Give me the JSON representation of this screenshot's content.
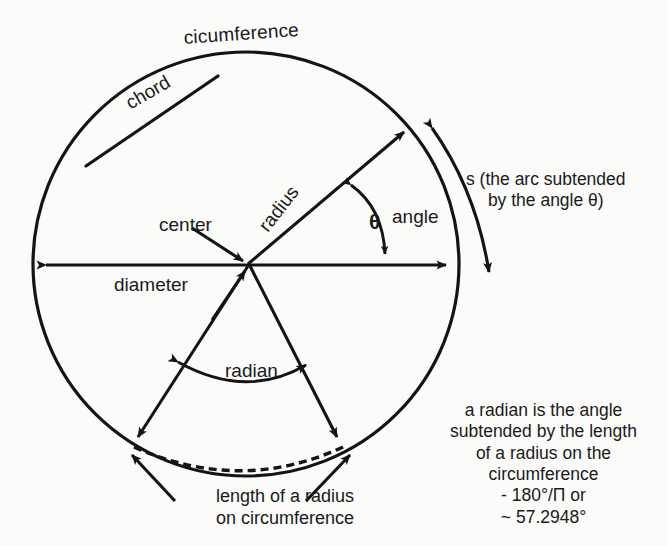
{
  "diagram": {
    "ink_color": "#141414",
    "background_color": "#fbfbfa",
    "labels": {
      "circumference": "cicumference",
      "chord": "chord",
      "radius": "radius",
      "center": "center",
      "diameter": "diameter",
      "theta": "θ",
      "angle": "angle",
      "radian": "radian",
      "arc_s": "s (the arc subtended\nby the angle θ)",
      "radian_definition": "a radian is the angle\nsubtended by the length\nof a radius on the\ncircumference\n- 180°/Π or\n~ 57.2948°",
      "length_of_radius": "length of a radius\non circumference"
    },
    "values": {
      "degrees_half_turn": "180°",
      "pi_symbol": "Π",
      "radian_in_degrees": "57.2948°"
    },
    "geometry": {
      "circle_center_x": 246,
      "circle_center_y": 264,
      "circle_radius_x": 213,
      "circle_radius_y": 212
    }
  }
}
